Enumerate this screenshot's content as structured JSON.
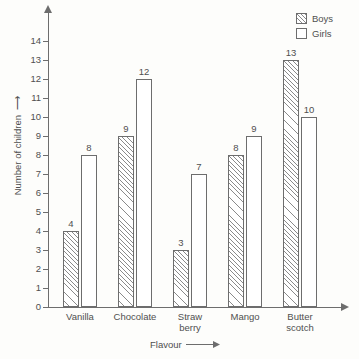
{
  "chart_data": {
    "type": "bar",
    "title": "",
    "xlabel": "Flavour",
    "ylabel": "Number of children",
    "categories": [
      "Vanilla",
      "Chocolate",
      "Straw\nberry",
      "Mango",
      "Butter\nscotch"
    ],
    "series": [
      {
        "name": "Boys",
        "values": [
          4,
          9,
          3,
          8,
          13
        ],
        "fill": "hatched"
      },
      {
        "name": "Girls",
        "values": [
          8,
          12,
          7,
          9,
          10
        ],
        "fill": "white"
      }
    ],
    "ylim": [
      0,
      14
    ],
    "yticks": [
      0,
      1,
      2,
      3,
      4,
      5,
      6,
      7,
      8,
      9,
      10,
      11,
      12,
      13,
      14
    ],
    "ytick_labels": [
      "0",
      "1",
      "2",
      "3",
      "4",
      "5",
      "6",
      "7",
      "8",
      "9",
      "10",
      "11",
      "12",
      "13",
      "14"
    ],
    "grid": false,
    "legend_position": "top-right",
    "axis_arrows": true,
    "colors": {
      "axis": "#6d6d6d",
      "text": "#4f4f4f",
      "bar_outline": "#6d6d6d",
      "hatch": "#8a8a8a",
      "background": "#fdfdfb"
    }
  },
  "legend": {
    "items": [
      {
        "label": "Boys",
        "swatch": "hatched-square-icon"
      },
      {
        "label": "Girls",
        "swatch": "empty-square-icon"
      }
    ]
  },
  "axes": {
    "y_title": "Number of children",
    "x_title": "Flavour"
  }
}
